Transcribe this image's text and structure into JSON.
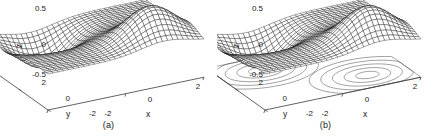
{
  "figure": {
    "type": "two-panel-3d-surface-figure",
    "background": "#ffffff",
    "ink": "#1a1a1a"
  },
  "panels": [
    {
      "id": "a",
      "caption": "(a)",
      "has_contour": false
    },
    {
      "id": "b",
      "caption": "(b)",
      "has_contour": true
    }
  ],
  "axes": {
    "z": {
      "label": "z",
      "ticks": [
        "0.5",
        "0",
        "-0.5"
      ],
      "tick_values": [
        0.5,
        0,
        -0.5
      ],
      "range": [
        -0.5,
        0.5
      ]
    },
    "y": {
      "label": "y",
      "ticks": [
        "2",
        "0",
        "-2"
      ],
      "tick_values": [
        2,
        0,
        -2
      ],
      "range": [
        -2,
        2
      ]
    },
    "x": {
      "label": "x",
      "ticks": [
        "-2",
        "0",
        "2"
      ],
      "tick_values": [
        -2,
        0,
        2
      ],
      "range": [
        -2,
        2
      ]
    }
  },
  "chart_data": {
    "type": "line",
    "title": "",
    "subtitle": "",
    "xlabel": "x",
    "ylabel": "y",
    "zlabel": "z",
    "surface_kind": "wireframe-mesh",
    "projection": "3d-isometric",
    "xlim": [
      -2,
      2
    ],
    "ylim": [
      -2,
      2
    ],
    "zlim": [
      -0.5,
      0.5
    ],
    "grid": false,
    "legend": null,
    "mesh_resolution": [
      30,
      30
    ],
    "function_description": "dipole of two opposite-sign Gaussian lobes",
    "features": [
      {
        "name": "peak",
        "x": 1.0,
        "y": -1.0,
        "z": 0.45
      },
      {
        "name": "valley",
        "x": -1.0,
        "y": 1.0,
        "z": -0.45
      }
    ],
    "contour_projection": {
      "present_in_panel": "b",
      "plane_z": -0.5,
      "levels": [
        -0.4,
        -0.3,
        -0.2,
        -0.12,
        -0.05,
        0.05,
        0.12,
        0.2,
        0.3,
        0.4
      ],
      "lobes": 2,
      "rings_per_lobe": 5
    },
    "x_ticks": [
      -2,
      0,
      2
    ],
    "y_ticks": [
      -2,
      0,
      2
    ],
    "z_ticks": [
      -0.5,
      0,
      0.5
    ]
  }
}
